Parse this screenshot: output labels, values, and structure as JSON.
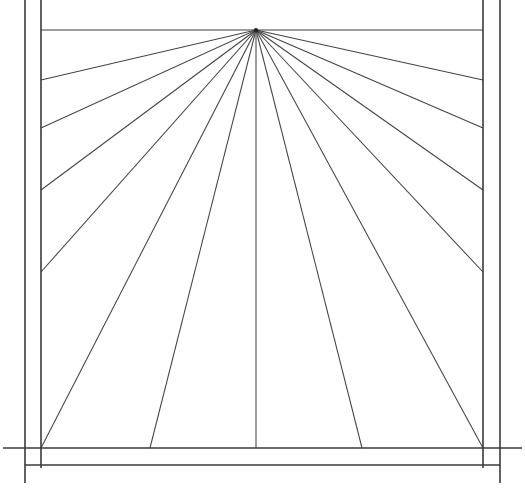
{
  "document": {
    "title": "One-Point Perspective Ray Diagram",
    "description": "Technical line drawing of a rectangular frame with radiating perspective lines converging to a single vanishing point near the top center.",
    "background_color": "#ffffff",
    "line_color": "#3a3a3a",
    "ray_color": "#444444"
  },
  "canvas": {
    "width": 525,
    "height": 501
  },
  "chart_data": {
    "type": "line",
    "xlabel": "",
    "ylabel": "",
    "xlim": [
      0,
      525
    ],
    "ylim": [
      0,
      501
    ],
    "grid": false,
    "legend": "none",
    "vanishing_point": {
      "x": 256,
      "y": 30,
      "label": "vanishing-point"
    },
    "outer_frame": {
      "label": "outer-frame",
      "left_x": 25,
      "right_x": 500,
      "top_y": -8,
      "bottom_y": 465
    },
    "inner_frame": {
      "label": "inner-frame",
      "left_x": 41,
      "right_x": 483,
      "top_y": -8,
      "bottom_y": 448
    },
    "horizon": {
      "label": "horizon-line",
      "y": 30,
      "x_start": 41,
      "x_end": 483
    },
    "rays": [
      {
        "id": "ray-L1",
        "side": "left",
        "end_x": 41,
        "end_y": 80
      },
      {
        "id": "ray-L2",
        "side": "left",
        "end_x": 41,
        "end_y": 128
      },
      {
        "id": "ray-L3",
        "side": "left",
        "end_x": 41,
        "end_y": 190
      },
      {
        "id": "ray-L4",
        "side": "left",
        "end_x": 41,
        "end_y": 272
      },
      {
        "id": "ray-L5",
        "side": "corner",
        "end_x": 41,
        "end_y": 448
      },
      {
        "id": "ray-B1",
        "side": "bottom",
        "end_x": 150,
        "end_y": 448
      },
      {
        "id": "ray-B2",
        "side": "bottom",
        "end_x": 256,
        "end_y": 448
      },
      {
        "id": "ray-B3",
        "side": "bottom",
        "end_x": 362,
        "end_y": 448
      },
      {
        "id": "ray-R5",
        "side": "corner",
        "end_x": 483,
        "end_y": 448
      },
      {
        "id": "ray-R4",
        "side": "right",
        "end_x": 483,
        "end_y": 272
      },
      {
        "id": "ray-R3",
        "side": "right",
        "end_x": 483,
        "end_y": 190
      },
      {
        "id": "ray-R2",
        "side": "right",
        "end_x": 483,
        "end_y": 128
      },
      {
        "id": "ray-R1",
        "side": "right",
        "end_x": 483,
        "end_y": 80
      }
    ],
    "ray_count": 13
  }
}
